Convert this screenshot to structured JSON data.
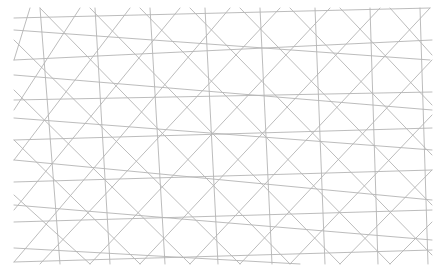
{
  "image": {
    "description": "Geometric interlaced line pattern (tessellation) drawn in thin gray lines on white background",
    "background": "#ffffff",
    "line_color": "#b4b4b4",
    "bounds": {
      "x0": 14,
      "y0": 8,
      "x1": 432,
      "y1": 264
    }
  },
  "lines": [
    [
      14,
      18,
      430,
      8
    ],
    [
      14,
      60,
      432,
      40
    ],
    [
      14,
      100,
      432,
      92
    ],
    [
      14,
      140,
      432,
      128
    ],
    [
      14,
      182,
      432,
      170
    ],
    [
      14,
      222,
      432,
      210
    ],
    [
      14,
      262,
      432,
      250
    ],
    [
      14,
      30,
      430,
      60
    ],
    [
      14,
      75,
      432,
      110
    ],
    [
      14,
      118,
      432,
      150
    ],
    [
      14,
      160,
      432,
      200
    ],
    [
      14,
      205,
      432,
      240
    ],
    [
      14,
      248,
      300,
      264
    ],
    [
      30,
      8,
      14,
      60
    ],
    [
      80,
      8,
      14,
      110
    ],
    [
      130,
      8,
      14,
      160
    ],
    [
      180,
      8,
      14,
      210
    ],
    [
      230,
      8,
      14,
      262
    ],
    [
      280,
      8,
      40,
      264
    ],
    [
      330,
      8,
      90,
      264
    ],
    [
      380,
      8,
      140,
      264
    ],
    [
      430,
      8,
      190,
      264
    ],
    [
      432,
      60,
      240,
      264
    ],
    [
      432,
      115,
      290,
      264
    ],
    [
      432,
      170,
      340,
      264
    ],
    [
      432,
      222,
      390,
      264
    ],
    [
      14,
      40,
      240,
      264
    ],
    [
      14,
      90,
      190,
      264
    ],
    [
      14,
      140,
      140,
      264
    ],
    [
      14,
      195,
      90,
      264
    ],
    [
      40,
      8,
      290,
      264
    ],
    [
      90,
      8,
      340,
      264
    ],
    [
      140,
      8,
      390,
      264
    ],
    [
      190,
      8,
      432,
      255
    ],
    [
      240,
      8,
      432,
      205
    ],
    [
      290,
      8,
      432,
      155
    ],
    [
      340,
      8,
      432,
      105
    ],
    [
      390,
      8,
      432,
      55
    ],
    [
      40,
      8,
      60,
      264
    ],
    [
      95,
      8,
      110,
      264
    ],
    [
      150,
      8,
      165,
      264
    ],
    [
      205,
      8,
      218,
      264
    ],
    [
      260,
      8,
      272,
      264
    ],
    [
      315,
      8,
      325,
      264
    ],
    [
      370,
      8,
      378,
      264
    ],
    [
      420,
      8,
      428,
      264
    ]
  ]
}
